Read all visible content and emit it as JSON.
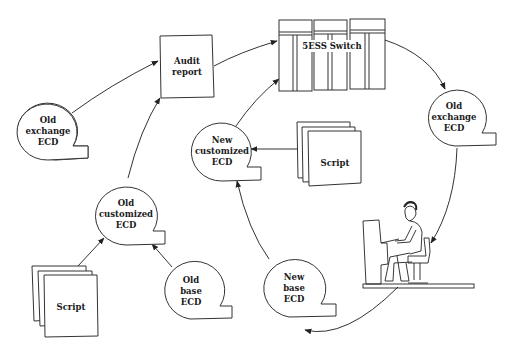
{
  "diagram": {
    "nodes": {
      "audit_report": [
        "Audit",
        "report"
      ],
      "switch": [
        "5ESS Switch"
      ],
      "old_exchange_ecd_left": [
        "Old",
        "exchange",
        "ECD"
      ],
      "old_exchange_ecd_right": [
        "Old",
        "exchange",
        "ECD"
      ],
      "new_customized_ecd": [
        "New",
        "customized",
        "ECD"
      ],
      "script_right": [
        "Script"
      ],
      "old_customized_ecd": [
        "Old",
        "customized",
        "ECD"
      ],
      "script_left": [
        "Script"
      ],
      "old_base_ecd": [
        "Old",
        "base",
        "ECD"
      ],
      "new_base_ecd": [
        "New",
        "base",
        "ECD"
      ]
    },
    "edges": [
      {
        "from": "Old exchange ECD (left)",
        "to": "Audit report"
      },
      {
        "from": "Old customized ECD",
        "to": "Audit report"
      },
      {
        "from": "Audit report",
        "to": "5ESS Switch"
      },
      {
        "from": "New customized ECD",
        "to": "5ESS Switch"
      },
      {
        "from": "5ESS Switch",
        "to": "Old exchange ECD (right)"
      },
      {
        "from": "Old exchange ECD (right)",
        "to": "Operator at terminal"
      },
      {
        "from": "Operator at terminal",
        "to": "New base ECD"
      },
      {
        "from": "New base ECD",
        "to": "New customized ECD"
      },
      {
        "from": "Script (right)",
        "to": "New customized ECD"
      },
      {
        "from": "Script (left)",
        "to": "Old customized ECD"
      },
      {
        "from": "Old base ECD",
        "to": "Old customized ECD"
      }
    ],
    "icons": {
      "operator": "person-at-terminal-icon"
    }
  }
}
